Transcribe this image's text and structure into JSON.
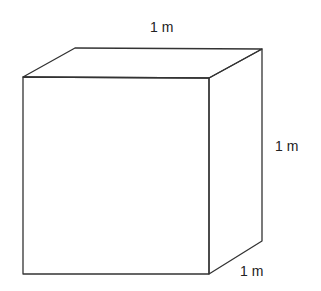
{
  "diagram": {
    "type": "3d-cube-oblique",
    "line_color": "#333333",
    "background": "#ffffff",
    "vertices": {
      "front_top_left": [
        23,
        77
      ],
      "front_top_right": [
        209,
        78
      ],
      "front_bottom_left": [
        23,
        274
      ],
      "front_bottom_right": [
        209,
        274
      ],
      "back_top_left": [
        75,
        48
      ],
      "back_top_right": [
        262,
        49
      ],
      "back_bottom_right": [
        262,
        241
      ]
    },
    "labels": {
      "top": "1 m",
      "right": "1 m",
      "depth": "1 m"
    }
  }
}
